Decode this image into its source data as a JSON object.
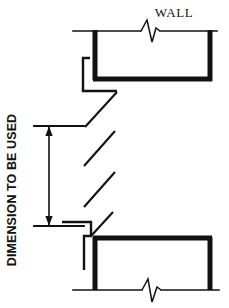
{
  "drawing": {
    "title_label": "WALL",
    "dimension_label": "DIMENSION TO BE USED",
    "ink_color": "#111111",
    "background_color": "#ffffff",
    "width_px": 229,
    "height_px": 308,
    "line_weights": {
      "thin_px": 1.4,
      "thick_px": 5.0
    },
    "elements": {
      "top_wall_line": "horizontal thin line with break symbol near right of center",
      "top_channel": "thick U-shaped channel open at top",
      "top_return_flange": "thin stepped flange at left of top channel",
      "break_lines": "three parallel diagonal break lines in middle region",
      "dimension_line": "vertical double-arrow dimension line at left",
      "extension_line_top": "horizontal thin extension line at top of dimension",
      "extension_line_bottom": "horizontal thin extension line at bottom of dimension",
      "bottom_channel": "thick inverted U-shaped channel open at bottom",
      "bottom_return_flange": "thin stepped flange at left of bottom channel",
      "bottom_wall_line": "horizontal thin line with break symbol near center"
    }
  }
}
